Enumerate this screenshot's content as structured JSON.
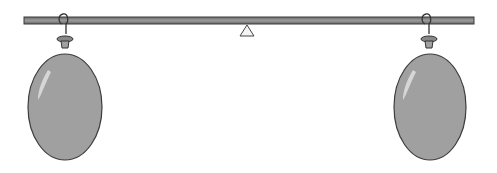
{
  "diagram": {
    "colors": {
      "beam": "#8a8a8a",
      "beam_outline": "#3a3a3a",
      "fulcrum_fill": "#f4f4f4",
      "fulcrum_outline": "#444444",
      "balloon_fill": "#a0a0a0",
      "balloon_outline": "#3c3c3c",
      "highlight": "#d6d6d6"
    },
    "balloons": [
      {
        "id": "left",
        "state": "inflated"
      },
      {
        "id": "right",
        "state": "inflated"
      }
    ],
    "balance_state": "level"
  }
}
